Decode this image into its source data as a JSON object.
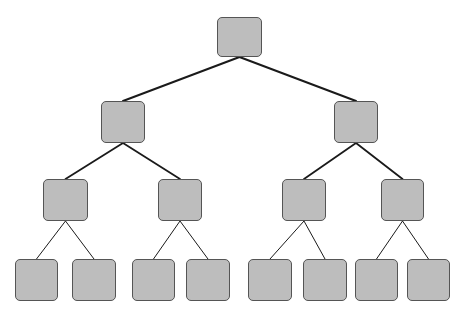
{
  "diagram": {
    "type": "binary-tree",
    "levels": 4,
    "style": {
      "node_fill": "#bdbdbd",
      "node_border": "#555555",
      "edge_color": "#1a1a1a",
      "background": "#ffffff"
    },
    "nodes": [
      {
        "id": "n0",
        "level": 0,
        "x": 217,
        "y": 17,
        "w": 45,
        "h": 40,
        "label": ""
      },
      {
        "id": "n1",
        "level": 1,
        "x": 101,
        "y": 101,
        "w": 44,
        "h": 42,
        "label": ""
      },
      {
        "id": "n2",
        "level": 1,
        "x": 334,
        "y": 101,
        "w": 44,
        "h": 42,
        "label": ""
      },
      {
        "id": "n3",
        "level": 2,
        "x": 43,
        "y": 179,
        "w": 45,
        "h": 42,
        "label": ""
      },
      {
        "id": "n4",
        "level": 2,
        "x": 158,
        "y": 179,
        "w": 44,
        "h": 42,
        "label": ""
      },
      {
        "id": "n5",
        "level": 2,
        "x": 282,
        "y": 179,
        "w": 44,
        "h": 42,
        "label": ""
      },
      {
        "id": "n6",
        "level": 2,
        "x": 381,
        "y": 179,
        "w": 43,
        "h": 42,
        "label": ""
      },
      {
        "id": "n7",
        "level": 3,
        "x": 15,
        "y": 259,
        "w": 43,
        "h": 42,
        "label": ""
      },
      {
        "id": "n8",
        "level": 3,
        "x": 72,
        "y": 259,
        "w": 44,
        "h": 42,
        "label": ""
      },
      {
        "id": "n9",
        "level": 3,
        "x": 132,
        "y": 259,
        "w": 43,
        "h": 42,
        "label": ""
      },
      {
        "id": "n10",
        "level": 3,
        "x": 186,
        "y": 259,
        "w": 44,
        "h": 42,
        "label": ""
      },
      {
        "id": "n11",
        "level": 3,
        "x": 248,
        "y": 259,
        "w": 44,
        "h": 42,
        "label": ""
      },
      {
        "id": "n12",
        "level": 3,
        "x": 303,
        "y": 259,
        "w": 44,
        "h": 42,
        "label": ""
      },
      {
        "id": "n13",
        "level": 3,
        "x": 355,
        "y": 259,
        "w": 43,
        "h": 42,
        "label": ""
      },
      {
        "id": "n14",
        "level": 3,
        "x": 407,
        "y": 259,
        "w": 43,
        "h": 42,
        "label": ""
      }
    ],
    "edges": [
      {
        "from": "n0",
        "to": "n1",
        "width": 2
      },
      {
        "from": "n0",
        "to": "n2",
        "width": 2
      },
      {
        "from": "n1",
        "to": "n3",
        "width": 1.8
      },
      {
        "from": "n1",
        "to": "n4",
        "width": 1.8
      },
      {
        "from": "n2",
        "to": "n5",
        "width": 1.8
      },
      {
        "from": "n2",
        "to": "n6",
        "width": 1.8
      },
      {
        "from": "n3",
        "to": "n7",
        "width": 1
      },
      {
        "from": "n3",
        "to": "n8",
        "width": 1
      },
      {
        "from": "n4",
        "to": "n9",
        "width": 1
      },
      {
        "from": "n4",
        "to": "n10",
        "width": 1
      },
      {
        "from": "n5",
        "to": "n11",
        "width": 1
      },
      {
        "from": "n5",
        "to": "n12",
        "width": 1
      },
      {
        "from": "n6",
        "to": "n13",
        "width": 1
      },
      {
        "from": "n6",
        "to": "n14",
        "width": 1
      }
    ]
  }
}
